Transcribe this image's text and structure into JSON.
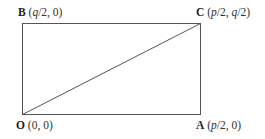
{
  "diagram": {
    "type": "rectangle-with-diagonal",
    "points": [
      {
        "id": "O",
        "letter": "O",
        "coord_open": " (0, 0)",
        "parts": [
          {
            "t": " (0, 0)",
            "i": false
          }
        ]
      },
      {
        "id": "A",
        "letter": "A",
        "parts": [
          {
            "t": " (",
            "i": false
          },
          {
            "t": "p",
            "i": true
          },
          {
            "t": "/2, 0)",
            "i": false
          }
        ]
      },
      {
        "id": "B",
        "letter": "B",
        "parts": [
          {
            "t": " (",
            "i": false
          },
          {
            "t": "q",
            "i": true
          },
          {
            "t": "/2, 0)",
            "i": false
          }
        ]
      },
      {
        "id": "C",
        "letter": "C",
        "parts": [
          {
            "t": " (",
            "i": false
          },
          {
            "t": "p",
            "i": true
          },
          {
            "t": "/2, ",
            "i": false
          },
          {
            "t": "q",
            "i": true
          },
          {
            "t": "/2)",
            "i": false
          }
        ]
      }
    ],
    "edges": [
      [
        "O",
        "A"
      ],
      [
        "A",
        "C"
      ],
      [
        "C",
        "B"
      ],
      [
        "B",
        "O"
      ]
    ],
    "diagonal": [
      "O",
      "C"
    ],
    "line_color": "#555555"
  }
}
